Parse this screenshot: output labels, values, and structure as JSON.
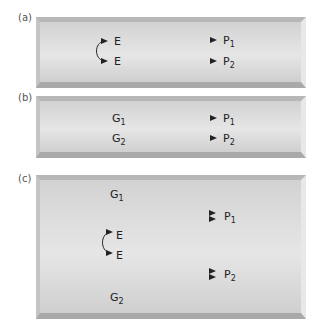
{
  "panels": [
    {
      "id": "a",
      "label": "(a)",
      "left": [
        {
          "text": "E",
          "sub": ""
        },
        {
          "text": "E",
          "sub": ""
        }
      ],
      "right": [
        {
          "text": "P",
          "sub": "1"
        },
        {
          "text": "P",
          "sub": "2"
        }
      ]
    },
    {
      "id": "b",
      "label": "(b)",
      "left": [
        {
          "text": "G",
          "sub": "1"
        },
        {
          "text": "G",
          "sub": "2"
        }
      ],
      "right": [
        {
          "text": "P",
          "sub": "1"
        },
        {
          "text": "P",
          "sub": "2"
        }
      ]
    },
    {
      "id": "c",
      "label": "(c)",
      "top": {
        "text": "G",
        "sub": "1"
      },
      "middle": [
        {
          "text": "E",
          "sub": ""
        },
        {
          "text": "E",
          "sub": ""
        }
      ],
      "bottom": {
        "text": "G",
        "sub": "2"
      },
      "right": [
        {
          "text": "P",
          "sub": "1"
        },
        {
          "text": "P",
          "sub": "2"
        }
      ]
    }
  ],
  "colors": {
    "panel_face": "#e0e0e0",
    "panel_edge": "#aaaaaa",
    "ink": "#222222"
  }
}
